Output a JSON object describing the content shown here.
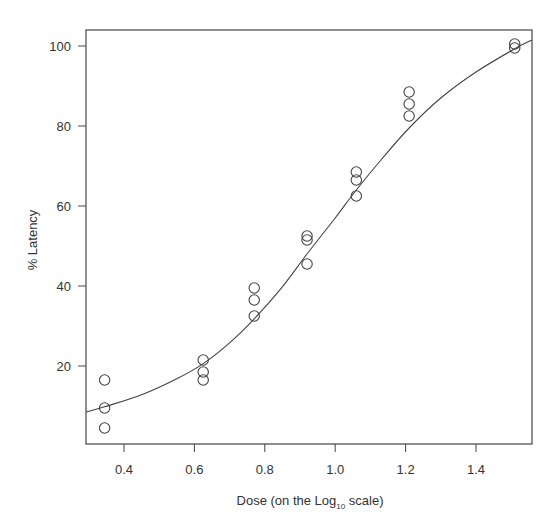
{
  "chart_data": {
    "type": "scatter",
    "title": "",
    "xlabel": "Dose (on the Log10 scale)",
    "xlabel_parts": {
      "pre": "Dose (on the Log",
      "sub": "10",
      "post": " scale)"
    },
    "ylabel": "% Latency",
    "xlim": [
      0.292,
      1.559
    ],
    "ylim": [
      0,
      101.5
    ],
    "x_ticks": [
      0.4,
      0.6,
      0.8,
      1.0,
      1.2,
      1.4
    ],
    "x_tick_labels": [
      "0.4",
      "0.6",
      "0.8",
      "1.0",
      "1.2",
      "1.4"
    ],
    "y_ticks": [
      20,
      40,
      60,
      80,
      100
    ],
    "y_tick_labels": [
      "20",
      "40",
      "60",
      "80",
      "100"
    ],
    "grid": false,
    "legend": null,
    "series": [
      {
        "name": "observed",
        "marker": "open-circle",
        "points": [
          [
            0.345,
            16.5
          ],
          [
            0.345,
            9.5
          ],
          [
            0.345,
            4.5
          ],
          [
            0.625,
            21.5
          ],
          [
            0.625,
            18.5
          ],
          [
            0.625,
            16.5
          ],
          [
            0.77,
            39.5
          ],
          [
            0.77,
            36.5
          ],
          [
            0.77,
            32.5
          ],
          [
            0.92,
            52.5
          ],
          [
            0.92,
            51.5
          ],
          [
            0.92,
            45.5
          ],
          [
            1.06,
            68.5
          ],
          [
            1.06,
            66.5
          ],
          [
            1.06,
            62.5
          ],
          [
            1.21,
            88.5
          ],
          [
            1.21,
            85.5
          ],
          [
            1.21,
            82.5
          ],
          [
            1.51,
            100.5
          ],
          [
            1.51,
            99.5
          ]
        ]
      },
      {
        "name": "fitted curve",
        "type": "line",
        "points": [
          [
            0.292,
            8.5
          ],
          [
            0.345,
            9.8
          ],
          [
            0.45,
            12.8
          ],
          [
            0.55,
            16.8
          ],
          [
            0.625,
            20.6
          ],
          [
            0.7,
            25.8
          ],
          [
            0.77,
            31.8
          ],
          [
            0.85,
            39.8
          ],
          [
            0.92,
            48.0
          ],
          [
            1.0,
            57.0
          ],
          [
            1.06,
            64.0
          ],
          [
            1.13,
            71.5
          ],
          [
            1.21,
            79.5
          ],
          [
            1.3,
            87.0
          ],
          [
            1.4,
            93.5
          ],
          [
            1.51,
            99.3
          ],
          [
            1.559,
            101.5
          ]
        ]
      }
    ]
  }
}
